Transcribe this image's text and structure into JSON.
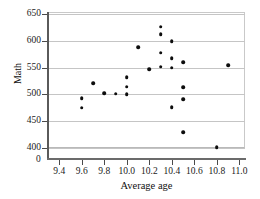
{
  "chart_data": {
    "type": "scatter",
    "title": "",
    "xlabel": "Average age",
    "ylabel": "Math",
    "xlim": [
      9.3,
      11.05
    ],
    "ylim": [
      395,
      650
    ],
    "grid": true,
    "legend": "none",
    "x_ticks": [
      "9.4",
      "9.6",
      "9.8",
      "10.0",
      "10.2",
      "10.4",
      "10.6",
      "10.8",
      "11.0"
    ],
    "x_tick_values": [
      9.4,
      9.6,
      9.8,
      10.0,
      10.2,
      10.4,
      10.6,
      10.8,
      11.0
    ],
    "y_ticks": [
      "400",
      "450",
      "500",
      "550",
      "600",
      "650"
    ],
    "y_tick_values": [
      400,
      450,
      500,
      550,
      600,
      650
    ],
    "y_axis_break_label": "0",
    "marker": "filled-circle",
    "marker_color": "#0d0d0d",
    "points": [
      {
        "x": 9.6,
        "y": 493
      },
      {
        "x": 9.6,
        "y": 475
      },
      {
        "x": 9.7,
        "y": 521
      },
      {
        "x": 9.8,
        "y": 502
      },
      {
        "x": 9.9,
        "y": 501
      },
      {
        "x": 10.0,
        "y": 532
      },
      {
        "x": 10.0,
        "y": 514
      },
      {
        "x": 10.0,
        "y": 500
      },
      {
        "x": 10.1,
        "y": 588
      },
      {
        "x": 10.2,
        "y": 547
      },
      {
        "x": 10.3,
        "y": 626
      },
      {
        "x": 10.3,
        "y": 612
      },
      {
        "x": 10.3,
        "y": 578
      },
      {
        "x": 10.3,
        "y": 552
      },
      {
        "x": 10.4,
        "y": 599
      },
      {
        "x": 10.4,
        "y": 568
      },
      {
        "x": 10.4,
        "y": 550
      },
      {
        "x": 10.4,
        "y": 476
      },
      {
        "x": 10.5,
        "y": 560
      },
      {
        "x": 10.5,
        "y": 513
      },
      {
        "x": 10.5,
        "y": 491
      },
      {
        "x": 10.5,
        "y": 430
      },
      {
        "x": 10.8,
        "y": 401
      },
      {
        "x": 10.9,
        "y": 554
      }
    ]
  }
}
